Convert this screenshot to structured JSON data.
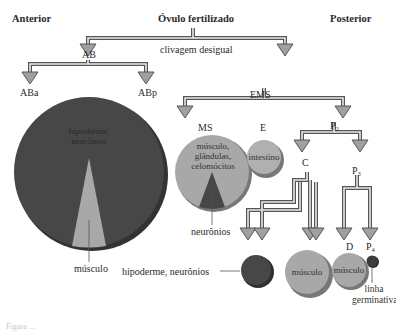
{
  "header": {
    "left": "Anterior",
    "center": "Óvulo fertilizado",
    "right": "Posterior"
  },
  "first_division_label": "clivagem desigual",
  "cells": {
    "AB": "AB",
    "ABa": "ABa",
    "ABp": "ABp",
    "EMS": "EMS",
    "MS": "MS",
    "E": "E",
    "P2": "P₂",
    "C": "C",
    "P3": "P₃",
    "D": "D",
    "P4": "P₄"
  },
  "fates": {
    "ab_main": "hipoderme, neurônios",
    "ab_wedge": "músculo",
    "ms_main": "músculo, glândulas, celomócitos",
    "ms_wedge": "neurônios",
    "e": "intestino",
    "c_dark": "hipoderme, neurônios",
    "c_light": "músculo",
    "d": "músculo",
    "p4": "linha germinativa"
  },
  "colors": {
    "dark_cell": "#474747",
    "light_cell": "#a8a8a8",
    "arrow_fill": "#a0a0a0",
    "arrow_stroke": "#555555"
  },
  "caption_partial": "Figura ..."
}
